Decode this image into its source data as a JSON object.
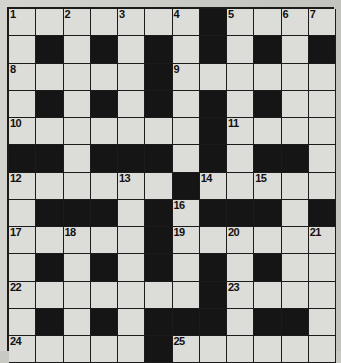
{
  "puzzle": {
    "type": "crossword-grid",
    "columns": 12,
    "rows": 13,
    "colors": {
      "block": "#151515",
      "open": "#dcdcd8",
      "grid_line": "#1b1b1b",
      "page": "#cfcfca",
      "number": "#111111"
    },
    "numbers_visible": [
      "1",
      "2",
      "3",
      "4",
      "5",
      "6",
      "7",
      "8",
      "9",
      "10",
      "11",
      "12",
      "13",
      "14",
      "15",
      "16",
      "17",
      "18",
      "19",
      "20",
      "21",
      "22",
      "23",
      "24",
      "25"
    ],
    "layout": [
      [
        "1",
        "",
        "2",
        "",
        "3",
        "",
        "4",
        "#",
        "5",
        "",
        "6",
        "7"
      ],
      [
        "",
        "#",
        "",
        "#",
        "",
        "#",
        "",
        "#",
        "",
        "#",
        "",
        "#"
      ],
      [
        "8",
        "",
        "",
        "",
        "",
        "#",
        "9",
        "",
        "",
        "",
        "",
        ""
      ],
      [
        "",
        "#",
        "",
        "#",
        "",
        "#",
        "",
        "#",
        "",
        "#",
        "",
        ""
      ],
      [
        "10",
        "",
        "",
        "",
        "",
        "",
        "",
        "#",
        "11",
        "",
        "",
        ""
      ],
      [
        "#",
        "#",
        "",
        "#",
        "#",
        "#",
        "",
        "#",
        "",
        "#",
        "#",
        ""
      ],
      [
        "12",
        "",
        "",
        "",
        "13",
        "",
        "#",
        "14",
        "",
        "15",
        "",
        ""
      ],
      [
        "",
        "#",
        "#",
        "#",
        "",
        "#",
        "16",
        "#",
        "#",
        "#",
        "",
        "#"
      ],
      [
        "17",
        "",
        "18",
        "",
        "",
        "#",
        "19",
        "",
        "20",
        "",
        "",
        "21"
      ],
      [
        "",
        "#",
        "",
        "#",
        "",
        "#",
        "",
        "#",
        "",
        "#",
        "",
        ""
      ],
      [
        "22",
        "",
        "",
        "",
        "",
        "",
        "",
        "#",
        "23",
        "",
        "",
        ""
      ],
      [
        "",
        "#",
        "",
        "#",
        "",
        "#",
        "#",
        "#",
        "",
        "#",
        "#",
        ""
      ],
      [
        "24",
        "",
        "",
        "",
        "",
        "#",
        "25",
        "",
        "",
        "",
        "",
        ""
      ]
    ]
  }
}
